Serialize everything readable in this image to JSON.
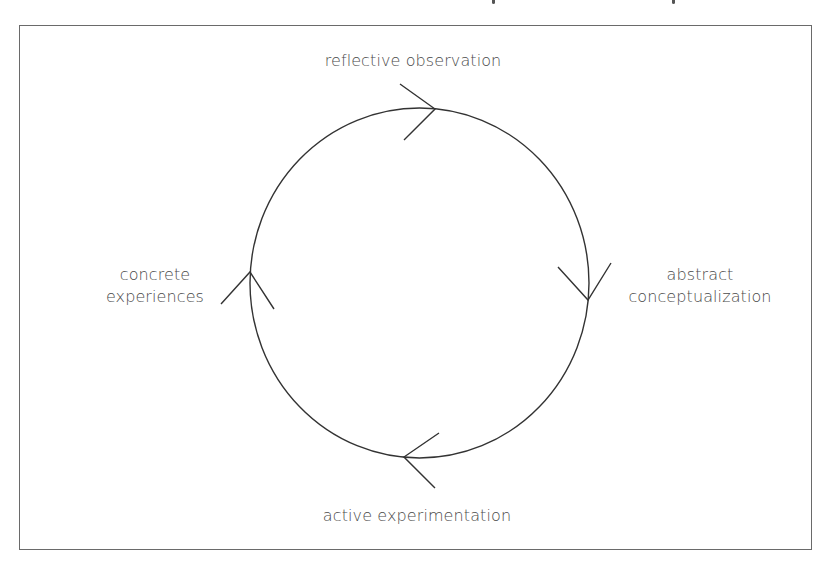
{
  "diagram": {
    "type": "cycle",
    "direction": "clockwise",
    "stroke_color": "#333333",
    "text_color": "#4a4a4a",
    "border_color": "#6a6a6a",
    "stages": [
      {
        "position": "top",
        "label_lines": [
          "reflective observation"
        ]
      },
      {
        "position": "right",
        "label_lines": [
          "abstract",
          "conceptualization"
        ]
      },
      {
        "position": "bottom",
        "label_lines": [
          "active experimentation"
        ]
      },
      {
        "position": "left",
        "label_lines": [
          "concrete",
          "experiences"
        ]
      }
    ],
    "arrows": [
      {
        "position": "top",
        "points_toward": "right"
      },
      {
        "position": "right",
        "points_toward": "down"
      },
      {
        "position": "bottom",
        "points_toward": "left"
      },
      {
        "position": "left",
        "points_toward": "up"
      }
    ]
  }
}
